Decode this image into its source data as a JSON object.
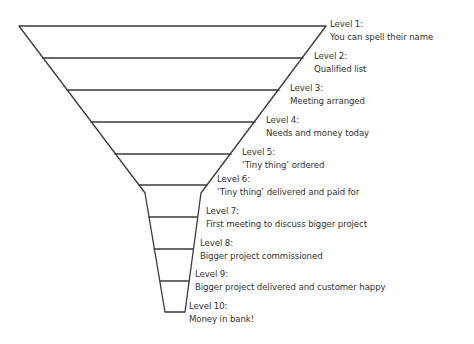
{
  "diagram": {
    "type": "sales-funnel",
    "line_color": "#3a3a3a",
    "text_color": "#333333",
    "levels": [
      {
        "title": "Level 1:",
        "desc": "You can spell their name"
      },
      {
        "title": "Level 2:",
        "desc": "Qualified list"
      },
      {
        "title": "Level 3:",
        "desc": "Meeting arranged"
      },
      {
        "title": "Level 4:",
        "desc": "Needs and money today"
      },
      {
        "title": "Level 5:",
        "desc": "‘Tiny thing’ ordered"
      },
      {
        "title": "Level 6:",
        "desc": "‘Tiny thing’ delivered and paid for"
      },
      {
        "title": "Level 7:",
        "desc": "First meeting to discuss bigger project"
      },
      {
        "title": "Level 8:",
        "desc": "Bigger project commissioned"
      },
      {
        "title": "Level 9:",
        "desc": "Bigger project delivered and customer happy"
      },
      {
        "title": "Level 10:",
        "desc": "Money in bank!"
      }
    ]
  }
}
